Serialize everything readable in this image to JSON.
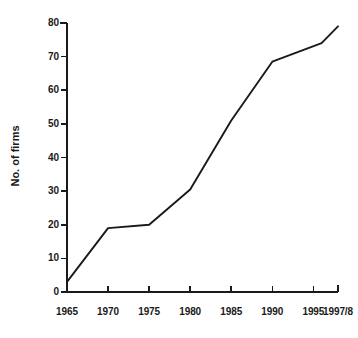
{
  "chart_data": {
    "type": "line",
    "title": "",
    "xlabel": "",
    "ylabel": "No. of firms",
    "x": [
      1965,
      1970,
      1975,
      1980,
      1985,
      1990,
      1996,
      1998
    ],
    "values": [
      3,
      19,
      20,
      30.5,
      51,
      68.5,
      74,
      79
    ],
    "series": [
      {
        "name": "No. of firms",
        "values": [
          3,
          19,
          20,
          30.5,
          51,
          68.5,
          74,
          79
        ]
      }
    ],
    "xlim": [
      1965,
      1998
    ],
    "ylim": [
      0,
      80
    ],
    "x_tick_labels": [
      "1965",
      "1970",
      "1975",
      "1980",
      "1985",
      "1990",
      "1995",
      "1997/8"
    ],
    "x_tick_values": [
      1965,
      1970,
      1975,
      1980,
      1985,
      1990,
      1995,
      1998
    ],
    "y_tick_labels": [
      "0",
      "10",
      "20",
      "30",
      "40",
      "50",
      "60",
      "70",
      "80"
    ],
    "y_tick_values": [
      0,
      10,
      20,
      30,
      40,
      50,
      60,
      70,
      80
    ],
    "grid": false,
    "legend": false,
    "legend_position": "none",
    "line_color": "#1a1a1a",
    "axis_color": "#1a1a1a",
    "background_color": "#ffffff"
  },
  "axis": {
    "y_title": "No. of firms"
  }
}
